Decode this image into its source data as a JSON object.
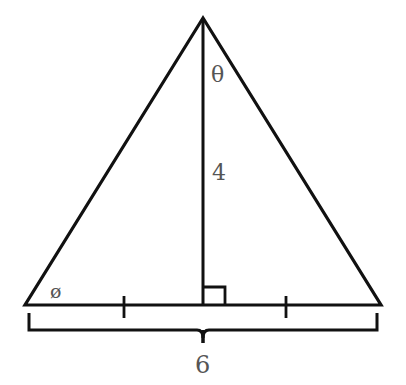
{
  "diagram": {
    "type": "isosceles-triangle-with-altitude",
    "labels": {
      "apex_angle": "θ",
      "base_angle": "ø",
      "height": "4",
      "base": "6"
    },
    "marks": {
      "right_angle": true,
      "equal_segment_ticks": 2
    },
    "colors": {
      "stroke": "#111111",
      "label": "#555555",
      "background": "#ffffff"
    }
  }
}
